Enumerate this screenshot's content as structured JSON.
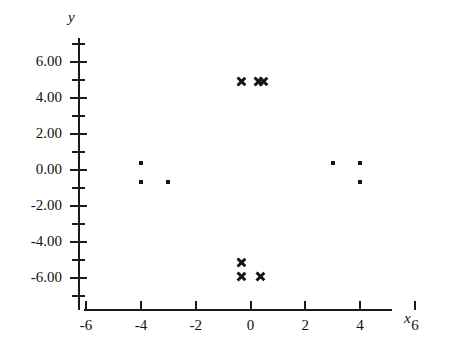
{
  "chart_data": {
    "type": "scatter",
    "title": "",
    "xlabel": "x",
    "ylabel": "y",
    "xlim": [
      -6,
      6
    ],
    "ylim": [
      -6,
      6
    ],
    "grid": false,
    "legend": "none",
    "x_ticks": [
      -6,
      -2,
      0,
      2,
      4,
      6
    ],
    "x_tick_labels": [
      "-6",
      "-4",
      "-2",
      "0",
      "2",
      "4",
      "6"
    ],
    "x_tick_values": [
      -6,
      -4,
      -2,
      0,
      2,
      4,
      6
    ],
    "x_minor_ticks": [],
    "y_tick_labels": [
      "6.00",
      "4.00",
      "2.00",
      "0.00",
      "-2.00",
      "-4.00",
      "-6.00"
    ],
    "y_tick_values": [
      6,
      4,
      2,
      0,
      -2,
      -4,
      -6
    ],
    "y_minor_ticks": [
      7,
      5,
      3,
      1,
      -1,
      -3,
      -5,
      -7
    ],
    "series": [
      {
        "name": "squares",
        "marker": "square",
        "color": "#141414",
        "points": [
          {
            "x": -4,
            "y": 0.4
          },
          {
            "x": -4,
            "y": -0.65
          },
          {
            "x": -3,
            "y": -0.65
          },
          {
            "x": 3,
            "y": 0.4
          },
          {
            "x": 4,
            "y": 0.4
          },
          {
            "x": 4,
            "y": -0.65
          }
        ]
      },
      {
        "name": "crosses",
        "marker": "x",
        "color": "#141414",
        "points": [
          {
            "x": -0.35,
            "y": 4.9
          },
          {
            "x": 0.3,
            "y": 4.9
          },
          {
            "x": 0.45,
            "y": 4.9
          },
          {
            "x": -0.35,
            "y": -5.15
          },
          {
            "x": -0.35,
            "y": -5.9
          },
          {
            "x": 0.35,
            "y": -5.9
          }
        ]
      }
    ]
  }
}
